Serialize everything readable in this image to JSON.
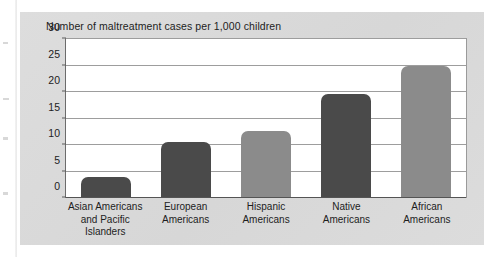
{
  "chart_data": {
    "type": "bar",
    "title": "Number of maltreatment cases per 1,000 children",
    "xlabel": "",
    "ylabel": "",
    "categories": [
      "Asian Americans and Pacific Islanders",
      "European Americans",
      "Hispanic Americans",
      "Native Americans",
      "African Americans"
    ],
    "category_lines": [
      [
        "Asian Americans",
        "and Pacific",
        "Islanders"
      ],
      [
        "European",
        "Americans"
      ],
      [
        "Hispanic",
        "Americans"
      ],
      [
        "Native",
        "Americans"
      ],
      [
        "African",
        "Americans"
      ]
    ],
    "values": [
      4.0,
      10.5,
      12.6,
      19.7,
      25.0
    ],
    "bar_colors": [
      "#4a4a4a",
      "#4a4a4a",
      "#8b8b8b",
      "#4a4a4a",
      "#8b8b8b"
    ],
    "ylim": [
      0,
      30
    ],
    "yticks": [
      0,
      5,
      10,
      15,
      20,
      25,
      30
    ],
    "ytick_labels": [
      "0",
      "5",
      "10",
      "15",
      "20",
      "25",
      "30"
    ],
    "grid": true,
    "legend": null
  },
  "figure": {
    "panel_color": "#dcdcdc",
    "plot_background": "#ffffff",
    "gridline_color": "#9d9d9d",
    "axis_color": "#545454",
    "text_color": "#1d1d1d"
  }
}
